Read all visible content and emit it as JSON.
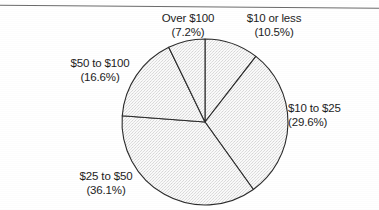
{
  "chart_data": {
    "type": "pie",
    "title": "",
    "subtitle": "",
    "xlabel": "",
    "ylabel": "",
    "legend_position": "none",
    "grid": false,
    "labels_outside": true,
    "start_angle_deg": 0,
    "direction": "clockwise",
    "categories": [
      "$10 or less",
      "$10 to $25",
      "$25 to $50",
      "$50 to $100",
      "Over $100"
    ],
    "values": [
      10.5,
      29.6,
      36.1,
      16.6,
      7.2
    ],
    "value_unit": "%",
    "total": 100.0,
    "slices": [
      {
        "name": "$10 or less",
        "percent": 10.5,
        "percent_label": "(10.5%)",
        "start_deg": 0.0,
        "end_deg": 37.8,
        "fill": "#f2f2f2",
        "stroke": "#2b2b2b"
      },
      {
        "name": "$10 to $25",
        "percent": 29.6,
        "percent_label": "(29.6%)",
        "start_deg": 37.8,
        "end_deg": 144.36,
        "fill": "#f2f2f2",
        "stroke": "#2b2b2b"
      },
      {
        "name": "$25 to $50",
        "percent": 36.1,
        "percent_label": "(36.1%)",
        "start_deg": 144.36,
        "end_deg": 274.32,
        "fill": "#f2f2f2",
        "stroke": "#2b2b2b"
      },
      {
        "name": "$50 to $100",
        "percent": 16.6,
        "percent_label": "(16.6%)",
        "start_deg": 274.32,
        "end_deg": 334.08,
        "fill": "#f2f2f2",
        "stroke": "#2b2b2b"
      },
      {
        "name": "Over $100",
        "percent": 7.2,
        "percent_label": "(7.2%)",
        "start_deg": 334.08,
        "end_deg": 360.0,
        "fill": "#f2f2f2",
        "stroke": "#2b2b2b"
      }
    ],
    "geometry": {
      "center_x": 205,
      "center_y": 122,
      "radius": 83
    },
    "colors": {
      "slice_fill": "#f2f2f2",
      "slice_outline": "#2b2b2b",
      "text": "#1d1d1d",
      "background": "#ffffff",
      "rule": "#6b6b6b"
    }
  },
  "labels": {
    "over_100": {
      "name": "Over $100",
      "percent": "(7.2%)"
    },
    "ten_or_less": {
      "name": "$10 or less",
      "percent": "(10.5%)"
    },
    "fifty_to_100": {
      "name": "$50 to $100",
      "percent": "(16.6%)"
    },
    "ten_to_25": {
      "name": "$10 to $25",
      "percent": "(29.6%)"
    },
    "twentyfive_to_50": {
      "name": "$25 to $50",
      "percent": "(36.1%)"
    }
  }
}
